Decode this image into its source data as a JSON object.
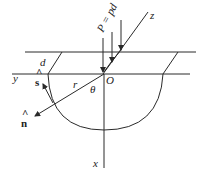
{
  "diagram": {
    "labels": {
      "load": "P = pd",
      "z_axis": "z",
      "y_axis": "y",
      "x_axis": "x",
      "origin": "O",
      "depth": "d",
      "radius": "r",
      "angle": "θ",
      "tangent_vector": "ŝ",
      "normal_vector": "n̂",
      "s_label": "s",
      "n_label": "n",
      "hat": "^"
    },
    "colors": {
      "line": "#2a2a2a",
      "background": "#ffffff"
    }
  }
}
